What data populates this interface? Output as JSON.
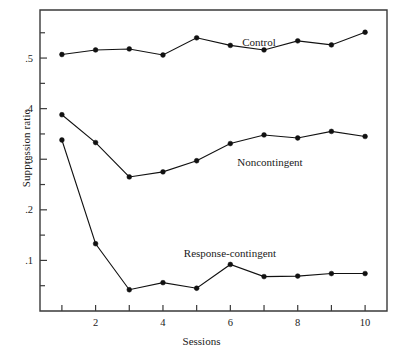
{
  "figure": {
    "xlabel": "Sessions",
    "ylabel": "Suppression ratio",
    "annotations": {
      "control": "Control",
      "noncontingent": "Noncontingent",
      "response_contingent": "Response-contingent"
    }
  },
  "chart_data": {
    "type": "line",
    "title": "",
    "xlabel": "Sessions",
    "ylabel": "Suppression ratio",
    "x": [
      1,
      2,
      3,
      4,
      5,
      6,
      7,
      8,
      9,
      10
    ],
    "xlim": [
      0.35,
      10.65
    ],
    "ylim": [
      0,
      0.595
    ],
    "xticks": [
      1,
      2,
      3,
      4,
      5,
      6,
      7,
      8,
      9,
      10
    ],
    "xticklabels": [
      "",
      "2",
      "",
      "4",
      "",
      "6",
      "",
      "8",
      "",
      "10"
    ],
    "yticks": [
      0.05,
      0.1,
      0.15,
      0.2,
      0.25,
      0.3,
      0.35,
      0.4,
      0.45,
      0.5,
      0.55
    ],
    "yticklabels": [
      "",
      ".1",
      "",
      ".2",
      "",
      ".3",
      "",
      ".4",
      "",
      ".5",
      ""
    ],
    "grid": false,
    "legend": "inline-annotations",
    "marker": "filled-circle",
    "series": [
      {
        "name": "Control",
        "values": [
          0.507,
          0.516,
          0.518,
          0.506,
          0.54,
          0.525,
          0.516,
          0.534,
          0.526,
          0.551
        ]
      },
      {
        "name": "Noncontingent",
        "values": [
          0.388,
          0.333,
          0.265,
          0.275,
          0.297,
          0.331,
          0.348,
          0.342,
          0.355,
          0.345
        ]
      },
      {
        "name": "Response-contingent",
        "values": [
          0.338,
          0.133,
          0.042,
          0.056,
          0.045,
          0.092,
          0.068,
          0.069,
          0.074,
          0.074
        ]
      }
    ]
  },
  "colors": {
    "line": "#111111",
    "axis": "#3a3a3a",
    "text": "#1a1a1a",
    "background": "#ffffff"
  }
}
